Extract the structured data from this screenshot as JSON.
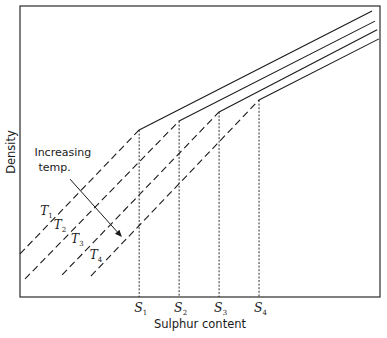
{
  "chart_data": {
    "type": "line",
    "title": "",
    "xlabel": "Sulphur content",
    "ylabel": "Density",
    "xlim": [
      0,
      1
    ],
    "ylim": [
      0,
      1
    ],
    "grid": false,
    "legend": "none",
    "x_ticks": [
      {
        "label": "S",
        "sub": "1",
        "x": 0.331
      },
      {
        "label": "S",
        "sub": "2",
        "x": 0.442
      },
      {
        "label": "S",
        "sub": "3",
        "x": 0.553
      },
      {
        "label": "S",
        "sub": "4",
        "x": 0.664
      }
    ],
    "series": [
      {
        "name": "T1",
        "label": "T",
        "sub": "1",
        "dashed_segment": [
          [
            0.0,
            0.148
          ],
          [
            0.331,
            0.574
          ]
        ],
        "solid_segment": [
          [
            0.331,
            0.574
          ],
          [
            0.978,
            0.983
          ]
        ],
        "label_at": [
          0.056,
          0.282
        ]
      },
      {
        "name": "T2",
        "label": "T",
        "sub": "2",
        "dashed_segment": [
          [
            0.014,
            0.062
          ],
          [
            0.442,
            0.605
          ]
        ],
        "solid_segment": [
          [
            0.442,
            0.605
          ],
          [
            0.986,
            0.948
          ]
        ],
        "label_at": [
          0.094,
          0.234
        ]
      },
      {
        "name": "T3",
        "label": "T",
        "sub": "3",
        "dashed_segment": [
          [
            0.117,
            0.076
          ],
          [
            0.553,
            0.636
          ]
        ],
        "solid_segment": [
          [
            0.553,
            0.636
          ],
          [
            0.992,
            0.918
          ]
        ],
        "label_at": [
          0.142,
          0.186
        ]
      },
      {
        "name": "T4",
        "label": "T",
        "sub": "4",
        "dashed_segment": [
          [
            0.197,
            0.072
          ],
          [
            0.664,
            0.677
          ]
        ],
        "solid_segment": [
          [
            0.664,
            0.677
          ],
          [
            0.997,
            0.887
          ]
        ],
        "label_at": [
          0.194,
          0.131
        ]
      }
    ],
    "annotations": [
      {
        "text_lines": [
          "Increasing",
          "temp."
        ],
        "text_at": [
          0.04,
          0.485
        ],
        "arrow_from": [
          0.139,
          0.405
        ],
        "arrow_to": [
          0.283,
          0.206
        ]
      }
    ]
  }
}
